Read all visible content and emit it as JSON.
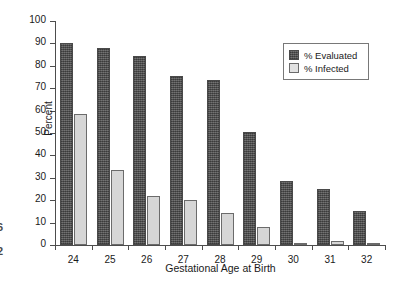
{
  "chart_data": {
    "type": "bar",
    "title": "",
    "xlabel": "Gestational Age at Birth",
    "ylabel": "Percent",
    "categories": [
      "24",
      "25",
      "26",
      "27",
      "28",
      "29",
      "30",
      "31",
      "32"
    ],
    "series": [
      {
        "name": "% Evaluated",
        "color": "#595959",
        "values": [
          90,
          88,
          84.5,
          75.5,
          73.5,
          50.5,
          28.5,
          25,
          15
        ]
      },
      {
        "name": "% Infected",
        "color": "#d6d6d6",
        "values": [
          58.5,
          33.5,
          22,
          20,
          14.5,
          8,
          0.8,
          2,
          1
        ]
      }
    ],
    "ylim": [
      0,
      100
    ],
    "yticks": [
      0,
      10,
      20,
      30,
      40,
      50,
      60,
      70,
      80,
      90,
      100
    ],
    "ytick_labels": [
      "0",
      "10",
      "20",
      "30",
      "40",
      "50",
      "60",
      "70",
      "80",
      "90",
      "100"
    ],
    "grid": false,
    "legend_position": "upper-right"
  },
  "legend": {
    "entries": [
      {
        "label": "% Evaluated",
        "swatch": "evaluated"
      },
      {
        "label": "% Infected",
        "swatch": "infected"
      }
    ]
  },
  "edge_artifact": {
    "line1": "6",
    "line2": "2"
  }
}
